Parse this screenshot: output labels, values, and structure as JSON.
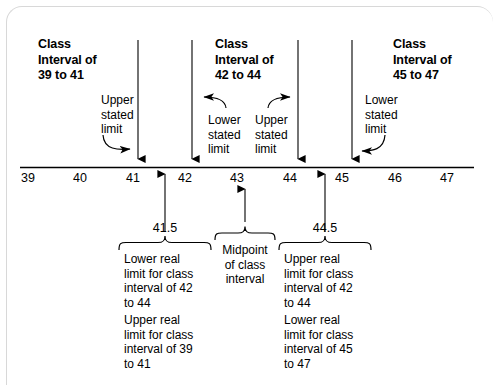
{
  "figure": {
    "type": "number-line-diagram",
    "topic": "Class intervals, stated limits, real limits, and midpoints"
  },
  "axis": {
    "name": "number-line",
    "ticks": [
      "39",
      "40",
      "41",
      "42",
      "43",
      "44",
      "45",
      "46",
      "47"
    ],
    "min": 39,
    "max": 47,
    "color": "#000000"
  },
  "class_intervals": [
    {
      "title_line1": "Class",
      "title_line2": "Interval of",
      "title_line3": "39 to 41"
    },
    {
      "title_line1": "Class",
      "title_line2": "Interval of",
      "title_line3": "42 to 44"
    },
    {
      "title_line1": "Class",
      "title_line2": "Interval of",
      "title_line3": "45 to 47"
    }
  ],
  "stated_limit_labels": [
    {
      "id": "upper-stated-limit-41",
      "line1": "Upper",
      "line2": "stated",
      "line3": "limit",
      "points_to": "41"
    },
    {
      "id": "lower-stated-limit-42",
      "line1": "Lower",
      "line2": "stated",
      "line3": "limit",
      "points_to": "42"
    },
    {
      "id": "upper-stated-limit-44",
      "line1": "Upper",
      "line2": "stated",
      "line3": "limit",
      "points_to": "44"
    },
    {
      "id": "lower-stated-limit-45",
      "line1": "Lower",
      "line2": "stated",
      "line3": "limit",
      "points_to": "45"
    }
  ],
  "real_limits": [
    {
      "value": "41.5",
      "primary": "Lower real limit for class interval of 42 to 44",
      "primary_lines": [
        "Lower real",
        "limit for class",
        "interval of 42",
        "to 44"
      ],
      "secondary": "Upper real limit for class interval of 39 to 41",
      "secondary_lines": [
        "Upper real",
        "limit for class",
        "interval of 39",
        "to 41"
      ]
    },
    {
      "value": "44.5",
      "primary": "Upper real limit for class interval of 42 to 44",
      "primary_lines": [
        "Upper real",
        "limit for class",
        "interval of 42",
        "to 44"
      ],
      "secondary": "Lower real limit for class interval of 45 to 47",
      "secondary_lines": [
        "Lower real",
        "limit for class",
        "interval of 45",
        "to 47"
      ]
    }
  ],
  "midpoint": {
    "value": "43",
    "lines": [
      "Midpoint",
      "of class",
      "interval"
    ]
  }
}
